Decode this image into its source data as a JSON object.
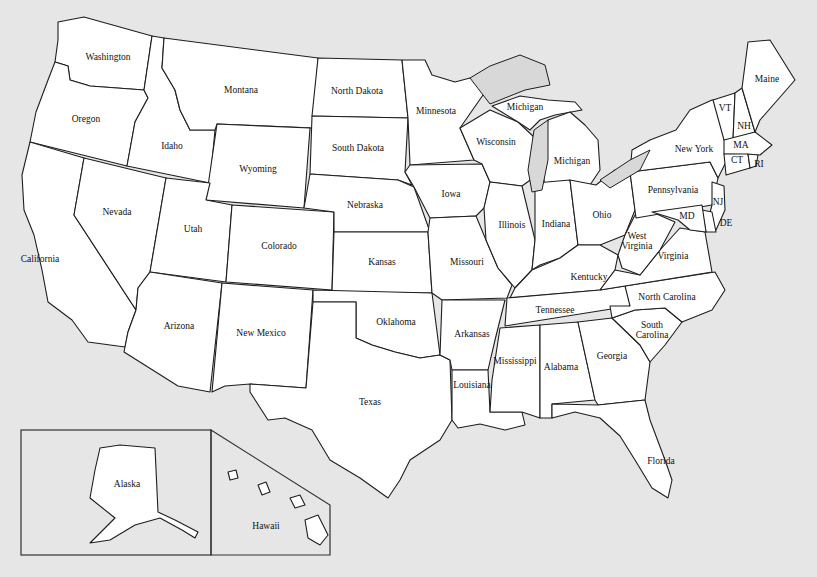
{
  "map": {
    "title": "United States",
    "background_color": "#e6e6e6",
    "land_color": "#ffffff",
    "border_color": "#1e1e1e",
    "lake_color": "#d8d8d8"
  },
  "states": {
    "washington": "Washington",
    "oregon": "Oregon",
    "california": "California",
    "idaho": "Idaho",
    "nevada": "Nevada",
    "montana": "Montana",
    "wyoming": "Wyoming",
    "utah": "Utah",
    "arizona": "Arizona",
    "colorado": "Colorado",
    "new_mexico": "New Mexico",
    "north_dakota": "North Dakota",
    "south_dakota": "South Dakota",
    "nebraska": "Nebraska",
    "kansas": "Kansas",
    "oklahoma": "Oklahoma",
    "texas": "Texas",
    "minnesota": "Minnesota",
    "iowa": "Iowa",
    "missouri": "Missouri",
    "arkansas": "Arkansas",
    "louisiana": "Louisiana",
    "wisconsin": "Wisconsin",
    "illinois": "Illinois",
    "michigan_upper": "Michigan",
    "michigan_lower": "Michigan",
    "indiana": "Indiana",
    "ohio": "Ohio",
    "kentucky": "Kentucky",
    "tennessee": "Tennessee",
    "mississippi": "Mississippi",
    "alabama": "Alabama",
    "georgia": "Georgia",
    "florida": "Florida",
    "south_carolina_1": "South",
    "south_carolina_2": "Carolina",
    "north_carolina": "North Carolina",
    "virginia": "Virginia",
    "west_virginia_1": "West",
    "west_virginia_2": "Virginia",
    "pennsylvania": "Pennsylvania",
    "new_york": "New York",
    "maryland": "MD",
    "delaware": "DE",
    "new_jersey": "NJ",
    "connecticut": "CT",
    "rhode_island": "RI",
    "massachusetts": "MA",
    "vermont": "VT",
    "new_hampshire": "NH",
    "maine": "Maine",
    "alaska": "Alaska",
    "hawaii": "Hawaii"
  }
}
